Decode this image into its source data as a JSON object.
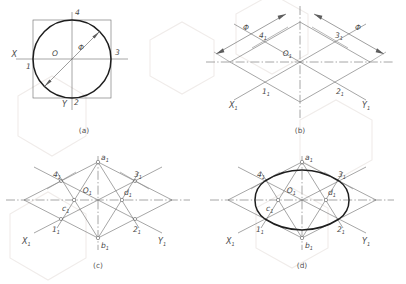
{
  "figure": {
    "background_color": "#ffffff",
    "line_color": "#6e6e6e",
    "outline_color": "#1e1e1e",
    "label_color": "#4a4a4a",
    "watermark_color": "#f0ecea"
  },
  "panels": [
    {
      "id": "a",
      "caption": "(a)",
      "description": "Circle inscribed in square, front view with diameter dimension",
      "axis_labels": {
        "x": "X",
        "y": "Y"
      },
      "center_label": "O",
      "diameter_symbol": "Φ",
      "points": [
        {
          "label": "1",
          "sub": ""
        },
        {
          "label": "2",
          "sub": ""
        },
        {
          "label": "3",
          "sub": ""
        },
        {
          "label": "4",
          "sub": ""
        }
      ]
    },
    {
      "id": "b",
      "caption": "(b)",
      "description": "Isometric rhombus of the circumscribing square with diameter dimensions",
      "axis_labels": {
        "x": "X",
        "x_sub": "1",
        "y": "Y",
        "y_sub": "1"
      },
      "center_label": "O",
      "center_sub": "1",
      "diameter_symbol": "Φ",
      "dimensions": [
        {
          "label": "Φ",
          "side": "left"
        },
        {
          "label": "Φ",
          "side": "right"
        }
      ],
      "points": [
        {
          "label": "1",
          "sub": "1"
        },
        {
          "label": "2",
          "sub": "1"
        },
        {
          "label": "3",
          "sub": "1"
        },
        {
          "label": "4",
          "sub": "1"
        }
      ]
    },
    {
      "id": "c",
      "caption": "(c)",
      "description": "Construction lines from obtuse vertices locating arc centres",
      "axis_labels": {
        "x": "X",
        "x_sub": "1",
        "y": "Y",
        "y_sub": "1"
      },
      "center_label": "O",
      "center_sub": "1",
      "points": [
        {
          "label": "1",
          "sub": "1"
        },
        {
          "label": "2",
          "sub": "1"
        },
        {
          "label": "3",
          "sub": "1"
        },
        {
          "label": "4",
          "sub": "1"
        },
        {
          "label": "a",
          "sub": "1"
        },
        {
          "label": "b",
          "sub": "1"
        },
        {
          "label": "c",
          "sub": "1"
        },
        {
          "label": "d",
          "sub": "1"
        }
      ]
    },
    {
      "id": "d",
      "caption": "(d)",
      "description": "Completed four-arc isometric ellipse drawn through points 1, 2, 3, 4",
      "axis_labels": {
        "x": "X",
        "x_sub": "1",
        "y": "Y",
        "y_sub": "1"
      },
      "center_label": "O",
      "center_sub": "1",
      "points": [
        {
          "label": "1",
          "sub": "1"
        },
        {
          "label": "2",
          "sub": "1"
        },
        {
          "label": "3",
          "sub": "1"
        },
        {
          "label": "4",
          "sub": "1"
        },
        {
          "label": "a",
          "sub": "1"
        },
        {
          "label": "b",
          "sub": "1"
        },
        {
          "label": "c",
          "sub": "1"
        },
        {
          "label": "d",
          "sub": "1"
        }
      ]
    }
  ]
}
